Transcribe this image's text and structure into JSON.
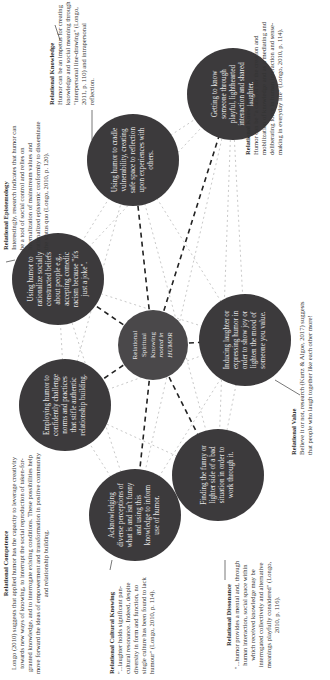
{
  "center": {
    "line1": "Relational",
    "line2": "Spiritual",
    "line3": "Knowing",
    "line4": "rooted in",
    "line5": "HUMOR"
  },
  "nodes": [
    {
      "id": "rationalize",
      "text": "Using humor to rationalize socially constructed beliefs about people e.g., accepting comedic racism because \"it's just a joke\"."
    },
    {
      "id": "vulnerability",
      "text": "Using humor to cradle vulnerability, creating safe space to reflection upon experiences with others."
    },
    {
      "id": "getting-to-know",
      "text": "Getting to know someone through playful, lighthearted interaction and shared laughter."
    },
    {
      "id": "inducing-laughter",
      "text": "Inducing laughter or expressing humor in order to show joy or lighten the mood of someone you value."
    },
    {
      "id": "finding-funny",
      "text": "Finding the funny or lighter side of a bad situation in order to work through it."
    },
    {
      "id": "acknowledging",
      "text": "Acknowledging diverse perceptions of what is and isn't funny and using this knowledge to inform use of humor."
    },
    {
      "id": "employing",
      "text": "Employing humor to confidently challenge norms and practices that stifle authentic relationship building."
    }
  ],
  "annotations": {
    "epistemology": {
      "title": "Relational Epistemology",
      "body": "Interestingly, research indicates that humor can be a tool of social control and relies on internalization of mainstream values and rationalized epistemic conformity to disseminate the status quo (Longo, 2010, p. 120)."
    },
    "knowledge": {
      "title": "Relational Knowledge",
      "body": "Humor can be an impetus for creating knowledge and social meaning through \"interpersonal line-drawing\" (Longo, 2011, p. 110) and intrapersonal reflection."
    },
    "knowing": {
      "title": "Relational Knowing",
      "body": "Humor can be \"a catalyst for the creation and mobilization of knowledge and as a mediating and deliberating force in human interaction and sense-making in everyday life\" (Longo, 2010, p. 114)."
    },
    "value": {
      "title": "Relational Value",
      "body": "Believe it or not, research (Kurtz & Algoe, 2017) suggests that people who laugh together like each other more!"
    },
    "dissonance": {
      "title": "Relational Dissonance",
      "body": "\"...humor provides a mental and, through human interaction, social space within which received knowledge may be interrogated collectively and alternative meanings playfully considered\" (Longo, 2010, p. 116)."
    },
    "cultural": {
      "title": "Relational Cultural Knowing",
      "body": "\"...laughter holds significant pan-cultural resonance. Indeed, despite diversity in form and function, no single culture has been found to lack humour\" (Longo, 2010, p. 114)."
    },
    "competence": {
      "title": "Relational Competence",
      "body": "Longo (2010) suggests that applied humor has the capacity to leverage creativity towards new ways of knowing, to interrupt the social reproduction of taken-for-granted knowledge, and to interrogate existing conditions. These possibilities help move forward the ideas of empowerment and transformation in positive community and relationship building."
    }
  },
  "colors": {
    "node_fill": "#3c3a3c",
    "node_text": "#e9e9e9",
    "spoke_line": "#222222",
    "web_line": "#c8c8c8",
    "background": "#ffffff"
  }
}
